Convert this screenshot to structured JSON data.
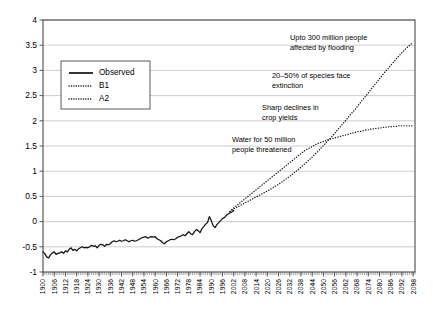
{
  "chart_data": {
    "type": "line",
    "title": "",
    "xlabel": "",
    "ylabel": "",
    "xlim": [
      1900,
      2099
    ],
    "ylim": [
      -1,
      4
    ],
    "ytick_labels": [
      "4",
      "3.5",
      "3",
      "2.5",
      "2",
      "1.5",
      "1",
      "0.5",
      "0",
      "-0.5",
      "-1"
    ],
    "ytick_values": [
      4,
      3.5,
      3,
      2.5,
      2,
      1.5,
      1,
      0.5,
      0,
      -0.5,
      -1
    ],
    "xtick_labels": [
      "1900",
      "1906",
      "1912",
      "1918",
      "1924",
      "1930",
      "1936",
      "1942",
      "1948",
      "1954",
      "1960",
      "1966",
      "1972",
      "1978",
      "1984",
      "1990",
      "1996",
      "2002",
      "2008",
      "2014",
      "2020",
      "2026",
      "2032",
      "2038",
      "2044",
      "2050",
      "2056",
      "2062",
      "2068",
      "2074",
      "2080",
      "2086",
      "2092",
      "2098"
    ],
    "grid": "horizontal",
    "legend_position": "upper-left",
    "legend": [
      "Observed",
      "B1",
      "A2"
    ],
    "series": [
      {
        "name": "Observed",
        "style": "solid",
        "x_start": 1900,
        "x_end": 2002,
        "values": [
          -0.6,
          -0.64,
          -0.7,
          -0.72,
          -0.66,
          -0.62,
          -0.6,
          -0.65,
          -0.63,
          -0.62,
          -0.6,
          -0.63,
          -0.58,
          -0.6,
          -0.55,
          -0.52,
          -0.57,
          -0.55,
          -0.58,
          -0.54,
          -0.52,
          -0.5,
          -0.52,
          -0.51,
          -0.52,
          -0.5,
          -0.47,
          -0.49,
          -0.48,
          -0.52,
          -0.47,
          -0.45,
          -0.46,
          -0.49,
          -0.45,
          -0.46,
          -0.44,
          -0.4,
          -0.38,
          -0.4,
          -0.39,
          -0.37,
          -0.39,
          -0.38,
          -0.36,
          -0.38,
          -0.4,
          -0.38,
          -0.37,
          -0.39,
          -0.38,
          -0.36,
          -0.34,
          -0.32,
          -0.31,
          -0.3,
          -0.33,
          -0.31,
          -0.3,
          -0.31,
          -0.3,
          -0.34,
          -0.36,
          -0.38,
          -0.42,
          -0.44,
          -0.4,
          -0.38,
          -0.36,
          -0.35,
          -0.36,
          -0.34,
          -0.31,
          -0.3,
          -0.28,
          -0.26,
          -0.28,
          -0.24,
          -0.2,
          -0.24,
          -0.26,
          -0.2,
          -0.16,
          -0.18,
          -0.22,
          -0.14,
          -0.1,
          -0.05,
          -0.02,
          0.1,
          0.02,
          -0.08,
          -0.12,
          -0.06,
          -0.02,
          0.02,
          0.06,
          0.08,
          0.12,
          0.15,
          0.17,
          0.19,
          0.22
        ]
      },
      {
        "name": "B1",
        "style": "dotted",
        "x_start": 2000,
        "x_end": 2098,
        "values": [
          0.2,
          0.24,
          0.27,
          0.3,
          0.33,
          0.36,
          0.39,
          0.42,
          0.45,
          0.48,
          0.51,
          0.54,
          0.57,
          0.6,
          0.63,
          0.66,
          0.69,
          0.72,
          0.75,
          0.78,
          0.81,
          0.84,
          0.87,
          0.9,
          0.93,
          0.96,
          0.99,
          1.02,
          1.05,
          1.08,
          1.11,
          1.14,
          1.17,
          1.2,
          1.23,
          1.26,
          1.29,
          1.32,
          1.35,
          1.38,
          1.41,
          1.43,
          1.45,
          1.47,
          1.49,
          1.51,
          1.53,
          1.55,
          1.56,
          1.58,
          1.59,
          1.6,
          1.62,
          1.63,
          1.64,
          1.65,
          1.66,
          1.67,
          1.68,
          1.69,
          1.7,
          1.71,
          1.72,
          1.73,
          1.74,
          1.75,
          1.76,
          1.77,
          1.78,
          1.79,
          1.79,
          1.8,
          1.81,
          1.82,
          1.82,
          1.83,
          1.84,
          1.84,
          1.85,
          1.85,
          1.86,
          1.86,
          1.87,
          1.87,
          1.88,
          1.88,
          1.88,
          1.89,
          1.89,
          1.89,
          1.9,
          1.9,
          1.9,
          1.9,
          1.9,
          1.9,
          1.9,
          1.9,
          1.9
        ]
      },
      {
        "name": "A2",
        "style": "dotted",
        "x_start": 2000,
        "x_end": 2098,
        "values": [
          0.2,
          0.24,
          0.27,
          0.3,
          0.33,
          0.36,
          0.39,
          0.42,
          0.45,
          0.48,
          0.51,
          0.54,
          0.57,
          0.6,
          0.63,
          0.66,
          0.7,
          0.73,
          0.77,
          0.81,
          0.85,
          0.89,
          0.93,
          0.98,
          1.02,
          1.07,
          1.12,
          1.17,
          1.22,
          1.27,
          1.33,
          1.38,
          1.44,
          1.5,
          1.56,
          1.62,
          1.68,
          1.74,
          1.81,
          1.87,
          1.94,
          2.0,
          2.07,
          2.14,
          2.2,
          2.27,
          2.34,
          2.41,
          2.48,
          2.55,
          2.62,
          2.69,
          2.76,
          2.83,
          2.9,
          2.97,
          3.03,
          3.1,
          3.16,
          3.23,
          3.29,
          3.35,
          3.41,
          3.46,
          3.51,
          3.55
        ]
      }
    ],
    "annotations": [
      {
        "id": "flooding",
        "line1": "Upto 300 million people",
        "line2": "affected by flooding",
        "gridline_value": 3.5
      },
      {
        "id": "extinction",
        "line1": "20–50% of species face",
        "line2": "extinction",
        "gridline_value": 3
      },
      {
        "id": "crop",
        "line1": "Sharp declines in",
        "line2": "crop yields",
        "gridline_value": 2.5
      },
      {
        "id": "water",
        "line1": "Water for 50 million",
        "line2": "people threatened",
        "gridline_value": 1.5
      }
    ],
    "colors": {
      "series": "#111111",
      "grid": "#b9b9b9",
      "frame": "#4a4a4a",
      "background": "#ffffff"
    }
  }
}
